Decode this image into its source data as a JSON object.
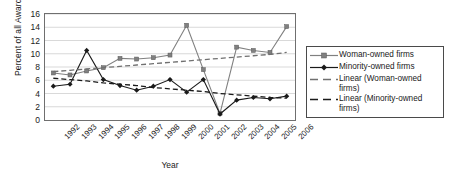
{
  "chart_data": {
    "type": "line",
    "title": "",
    "xlabel": "Year",
    "ylabel": "Percent of all Awards",
    "grid": true,
    "legend_position": "right",
    "ylim": [
      0,
      16
    ],
    "yticks": [
      0,
      2,
      4,
      6,
      8,
      10,
      12,
      14,
      16
    ],
    "categories": [
      "1992",
      "1993",
      "1994",
      "1995",
      "1996",
      "1997",
      "1998",
      "1999",
      "2000",
      "2001",
      "2002",
      "2003",
      "2004",
      "2005",
      "2006"
    ],
    "series": [
      {
        "name": "Woman-owned firms",
        "color": "#808080",
        "marker": "square",
        "style": "solid",
        "values": [
          7.1,
          6.8,
          7.4,
          7.9,
          9.3,
          9.2,
          9.4,
          9.8,
          14.3,
          7.6,
          1.0,
          11.0,
          10.5,
          10.2,
          14.1
        ]
      },
      {
        "name": "Minority-owned firms",
        "color": "#1a1a1a",
        "marker": "diamond",
        "style": "solid",
        "values": [
          5.1,
          5.4,
          10.5,
          6.1,
          5.2,
          4.5,
          5.1,
          6.1,
          4.2,
          6.1,
          0.9,
          3.0,
          3.4,
          3.2,
          3.6
        ]
      },
      {
        "name": "Linear (Woman-owned firms)",
        "color": "#707070",
        "marker": "none",
        "style": "dashed",
        "values": [
          7.3,
          7.5,
          7.7,
          7.9,
          8.1,
          8.3,
          8.5,
          8.7,
          8.9,
          9.1,
          9.3,
          9.5,
          9.7,
          9.9,
          10.2
        ]
      },
      {
        "name": "Linear (Minority-owned firms)",
        "color": "#1a1a1a",
        "marker": "none",
        "style": "dashed",
        "values": [
          6.3,
          6.1,
          5.9,
          5.6,
          5.4,
          5.2,
          4.9,
          4.7,
          4.5,
          4.3,
          4.0,
          3.8,
          3.6,
          3.4,
          3.3
        ]
      }
    ]
  },
  "legend": {
    "items": [
      {
        "label": "Woman-owned firms",
        "key": "line-square-gray"
      },
      {
        "label": "Minority-owned firms",
        "key": "line-diamond-black"
      },
      {
        "label": "Linear (Woman-owned firms)",
        "key": "dashed-gray"
      },
      {
        "label": "Linear (Minority-owned firms)",
        "key": "dashed-black"
      }
    ]
  }
}
